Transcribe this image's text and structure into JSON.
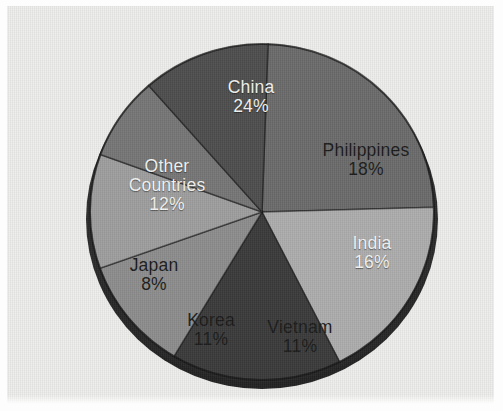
{
  "chart_data": {
    "type": "pie",
    "title": "",
    "subtitle": "",
    "xlabel": "",
    "ylabel": "",
    "legend": "none",
    "grid": false,
    "style": "3d-pie-exploded-none",
    "background_color": "#eeeeec",
    "categories": [
      "China",
      "Philippines",
      "India",
      "Vietnam",
      "Korea",
      "Japan",
      "Other Countries"
    ],
    "values": [
      24,
      18,
      16,
      11,
      11,
      8,
      12
    ],
    "value_unit": "%",
    "total": 100,
    "slices": [
      {
        "label": "China",
        "value": 24,
        "value_text": "24%",
        "color": "#6b6b6b",
        "text_color": "#f4f4f2",
        "start_angle": 272,
        "end_angle": 358.4
      },
      {
        "label": "Philippines",
        "value": 18,
        "value_text": "18%",
        "color": "#adadad",
        "text_color": "#1b1b1b",
        "start_angle": 358.4,
        "end_angle": 63.2
      },
      {
        "label": "India",
        "value": 16,
        "value_text": "16%",
        "color": "#3a3a3a",
        "text_color": "#f4f4f2",
        "start_angle": 63.2,
        "end_angle": 120.8
      },
      {
        "label": "Vietnam",
        "value": 11,
        "value_text": "11%",
        "color": "#8d8d8d",
        "text_color": "#1b1b1b",
        "start_angle": 120.8,
        "end_angle": 160.4
      },
      {
        "label": "Korea",
        "value": 11,
        "value_text": "11%",
        "color": "#9e9e9e",
        "text_color": "#1b1b1b",
        "start_angle": 160.4,
        "end_angle": 200.0
      },
      {
        "label": "Japan",
        "value": 8,
        "value_text": "8%",
        "color": "#767676",
        "text_color": "#1b1b1b",
        "start_angle": 200.0,
        "end_angle": 228.8
      },
      {
        "label": "Other Countries",
        "value": 12,
        "value_text": "12%",
        "color": "#4e4e4e",
        "text_color": "#f4f4f2",
        "start_angle": 228.8,
        "end_angle": 272.0
      }
    ],
    "labels": [
      {
        "name": "China",
        "pct": "24%"
      },
      {
        "name": "Philippines",
        "pct": "18%"
      },
      {
        "name": "India",
        "pct": "16%"
      },
      {
        "name": "Vietnam",
        "pct": "11%"
      },
      {
        "name": "Korea",
        "pct": "11%"
      },
      {
        "name": "Japan",
        "pct": "8%"
      },
      {
        "name": "Other",
        "pct": ""
      },
      {
        "name": "Countries",
        "pct": "12%"
      }
    ],
    "rim_color": "#2b2b2b"
  }
}
